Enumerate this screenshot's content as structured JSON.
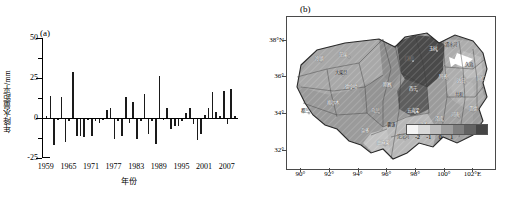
{
  "figure": {
    "panel_a_tag": "(a)",
    "panel_b_tag": "(b)"
  },
  "chart_data": [
    {
      "type": "bar",
      "title": "(a)",
      "xlabel": "年份",
      "ylabel": "年降水量距平/mm",
      "ylim": [
        -25,
        50
      ],
      "yticks": [
        -25,
        0,
        25,
        50
      ],
      "ytick_labels": [
        "-25",
        "0",
        "25",
        "50"
      ],
      "xticks": [
        1959,
        1965,
        1971,
        1977,
        1983,
        1989,
        1995,
        2001,
        2007
      ],
      "xtick_labels": [
        "1959",
        "1965",
        "1971",
        "1977",
        "1983",
        "1989",
        "1995",
        "2001",
        "2007"
      ],
      "xlim": [
        1958,
        2010
      ],
      "grid": false,
      "legend": "none",
      "categories": [
        1959,
        1960,
        1961,
        1962,
        1963,
        1964,
        1965,
        1966,
        1967,
        1968,
        1969,
        1970,
        1971,
        1972,
        1973,
        1974,
        1975,
        1976,
        1977,
        1978,
        1979,
        1980,
        1981,
        1982,
        1983,
        1984,
        1985,
        1986,
        1987,
        1988,
        1989,
        1990,
        1991,
        1992,
        1993,
        1994,
        1995,
        1996,
        1997,
        1998,
        1999,
        2000,
        2001,
        2002,
        2003,
        2004,
        2005,
        2006,
        2007,
        2008,
        2009
      ],
      "values": [
        1,
        14,
        -17,
        -1,
        13,
        -15,
        -2,
        29,
        -11,
        -11,
        -12,
        -1,
        -11,
        -2,
        -3,
        -1,
        5,
        6,
        -13,
        -2,
        -11,
        13,
        -3,
        10,
        -13,
        -2,
        15,
        -10,
        -2,
        -16,
        26,
        -1,
        6,
        -7,
        -5,
        -5,
        -2,
        3,
        6,
        -4,
        -14,
        -10,
        2,
        6,
        16,
        4,
        1,
        17,
        -4,
        18,
        1
      ]
    },
    {
      "type": "heatmap",
      "title": "(b)",
      "xlabel": "",
      "ylabel": "",
      "xticks": [
        90,
        92,
        94,
        96,
        98,
        100,
        102
      ],
      "xtick_labels": [
        "90°",
        "92°",
        "94°",
        "96°",
        "98°",
        "100°",
        "102°E"
      ],
      "yticks": [
        32,
        34,
        36,
        38
      ],
      "ytick_labels": [
        "32°",
        "34°",
        "36°",
        "38°N"
      ],
      "colorbar": {
        "ticks": [
          -2,
          -1,
          0,
          1
        ],
        "tick_labels": [
          "-2",
          "-1",
          "0",
          "1"
        ],
        "colors": [
          "#f5f5f5",
          "#d9d9d9",
          "#bdbdbd",
          "#9e9e9e",
          "#7f7f7f",
          "#636363",
          "#454545"
        ]
      },
      "region_labels": [
        "冷湖",
        "茫崖",
        "大柴旦",
        "德令哈",
        "格尔木",
        "都兰",
        "乌兰",
        "刚察",
        "门源",
        "西宁",
        "五道梁",
        "沱沱河",
        "曲麻莱",
        "玉树",
        "清水河",
        "玛多",
        "达日",
        "久治",
        "河南",
        "泽库",
        "囊谦",
        "杂多",
        "治多",
        "共和",
        "贵德",
        "同仁"
      ]
    }
  ]
}
